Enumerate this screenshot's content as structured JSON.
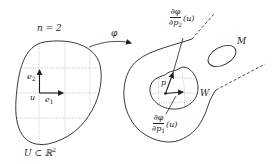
{
  "diagram": {
    "left_region": {
      "dimension_label": "n = 2",
      "set_label": "U ⊂ ℝ",
      "set_label_sup": "2",
      "point_label": "u",
      "basis": [
        {
          "label": "e",
          "sub": "1"
        },
        {
          "label": "e",
          "sub": "2"
        }
      ]
    },
    "map": {
      "label": "φ"
    },
    "right_region": {
      "manifold_label": "M",
      "neighborhood_label": "W",
      "point_label": "p",
      "partials": [
        {
          "num": "∂φ",
          "den": "∂p",
          "den_sub": "2",
          "arg": "(u)"
        },
        {
          "num": "∂φ",
          "den": "∂p",
          "den_sub": "1",
          "arg": "(u)"
        }
      ]
    },
    "colors": {
      "stroke": "#222222",
      "grid": "#9a9a9a",
      "background": "#ffffff"
    }
  }
}
